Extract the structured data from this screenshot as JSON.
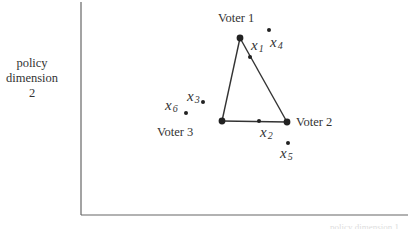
{
  "diagram": {
    "type": "spatial-voting-triangle",
    "y_axis_label": [
      "policy",
      "dimension",
      "2"
    ],
    "x_axis_label_clipped": "policy dimension 1",
    "colors": {
      "axis": "#555555",
      "line": "#333333",
      "point": "#222222",
      "text": "#333333"
    },
    "voters": [
      {
        "id": "voter-1",
        "label": "Voter 1",
        "x": 240,
        "y": 38
      },
      {
        "id": "voter-2",
        "label": "Voter 2",
        "x": 287,
        "y": 122
      },
      {
        "id": "voter-3",
        "label": "Voter 3",
        "x": 222,
        "y": 121
      }
    ],
    "points": [
      {
        "id": "x1",
        "base": "x",
        "sub": "1",
        "x": 250,
        "y": 57
      },
      {
        "id": "x2",
        "base": "x",
        "sub": "2",
        "x": 259,
        "y": 121
      },
      {
        "id": "x3",
        "base": "x",
        "sub": "3",
        "x": 203,
        "y": 102
      },
      {
        "id": "x4",
        "base": "x",
        "sub": "4",
        "x": 269,
        "y": 30
      },
      {
        "id": "x5",
        "base": "x",
        "sub": "5",
        "x": 288,
        "y": 143
      },
      {
        "id": "x6",
        "base": "x",
        "sub": "6",
        "x": 186,
        "y": 113
      }
    ]
  }
}
